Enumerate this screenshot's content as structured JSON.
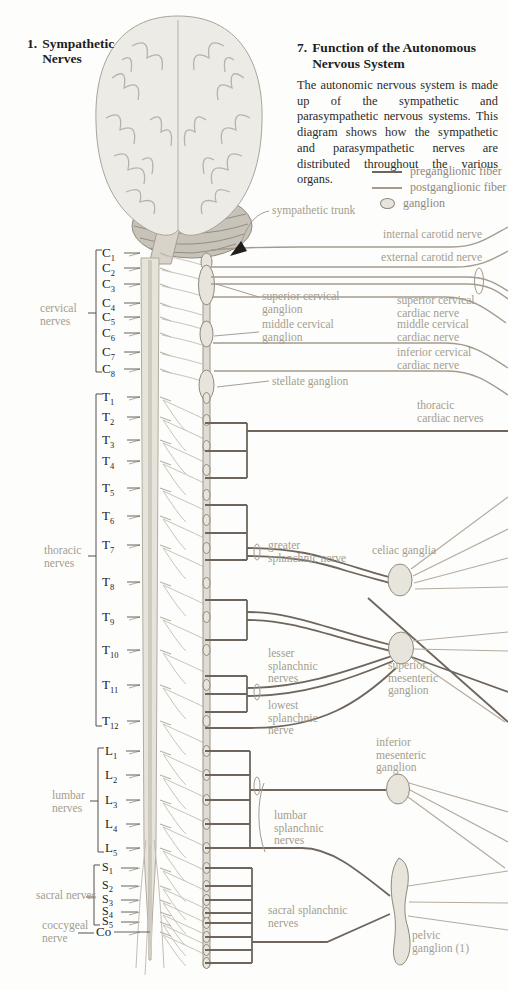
{
  "figure_title": {
    "number": "1.",
    "text": "Sympathetic Nerves"
  },
  "section": {
    "number": "7.",
    "title": "Function of the Autonomous Nervous System",
    "body": "The autonomic nervous system is made up of the sympathetic and parasympathetic nervous systems. This diagram shows how the sympathetic and parasympathetic nerves are distributed throughout the various organs."
  },
  "legend": [
    {
      "id": "preganglionic",
      "label": "preganglionic fiber",
      "swatch": "line-dark"
    },
    {
      "id": "postganglionic",
      "label": "postganglionic fiber",
      "swatch": "line-light"
    },
    {
      "id": "ganglion",
      "label": "ganglion",
      "swatch": "ellipse"
    }
  ],
  "colors": {
    "pre": "#6e665d",
    "post": "#a49a8e",
    "fan": "#b5ab9e",
    "gangfill": "#e7e4db",
    "gangstroke": "#8f897d",
    "labeltext": "#a49d8f"
  },
  "spinal_groups": [
    {
      "id": "cervical",
      "label_lines": [
        "cervical",
        "nerves"
      ],
      "segments": [
        "C1",
        "C2",
        "C3",
        "C4",
        "C5",
        "C6",
        "C7",
        "C8"
      ]
    },
    {
      "id": "thoracic",
      "label_lines": [
        "thoracic",
        "nerves"
      ],
      "segments": [
        "T1",
        "T2",
        "T3",
        "T4",
        "T5",
        "T6",
        "T7",
        "T8",
        "T9",
        "T10",
        "T11",
        "T12"
      ]
    },
    {
      "id": "lumbar",
      "label_lines": [
        "lumbar",
        "nerves"
      ],
      "segments": [
        "L1",
        "L2",
        "L3",
        "L4",
        "L5"
      ]
    },
    {
      "id": "sacral",
      "label_lines": [
        "sacral nerves"
      ],
      "segments": [
        "S1",
        "S2",
        "S3",
        "S4",
        "S5"
      ]
    },
    {
      "id": "coccygeal",
      "label_lines": [
        "coccygeal",
        "nerve"
      ],
      "segments": [
        "Co"
      ]
    }
  ],
  "diagram_labels": [
    {
      "id": "sympathetic-trunk",
      "lines": [
        "sympathetic trunk"
      ]
    },
    {
      "id": "internal-carotid-nerve",
      "lines": [
        "internal carotid nerve"
      ]
    },
    {
      "id": "external-carotid-nerve",
      "lines": [
        "external carotid nerve"
      ]
    },
    {
      "id": "superior-cervical-ganglion",
      "lines": [
        "superior cervical",
        "ganglion"
      ]
    },
    {
      "id": "superior-cervical-cardiac-nerve",
      "lines": [
        "superior cervical",
        "cardiac nerve"
      ]
    },
    {
      "id": "middle-cervical-ganglion",
      "lines": [
        "middle cervical",
        "ganglion"
      ]
    },
    {
      "id": "middle-cervical-cardiac-nerve",
      "lines": [
        "middle cervical",
        "cardiac nerve"
      ]
    },
    {
      "id": "inferior-cervical-cardiac-nerve",
      "lines": [
        "inferior cervical",
        "cardiac nerve"
      ]
    },
    {
      "id": "stellate-ganglion",
      "lines": [
        "stellate ganglion"
      ]
    },
    {
      "id": "thoracic-cardiac-nerves",
      "lines": [
        "thoracic",
        "cardiac nerves"
      ]
    },
    {
      "id": "greater-splanchnic-nerve",
      "lines": [
        "greater",
        "splanchnic nerve"
      ]
    },
    {
      "id": "celiac-ganglia",
      "lines": [
        "celiac ganglia"
      ]
    },
    {
      "id": "lesser-splanchnic-nerves",
      "lines": [
        "lesser",
        "splanchnic",
        "nerves"
      ]
    },
    {
      "id": "superior-mesenteric-ganglion",
      "lines": [
        "superior",
        "mesenteric",
        "ganglion"
      ]
    },
    {
      "id": "lowest-splanchnic-nerve",
      "lines": [
        "lowest",
        "splanchnic",
        "nerve"
      ]
    },
    {
      "id": "inferior-mesenteric-ganglion",
      "lines": [
        "inferior",
        "mesenteric",
        "ganglion"
      ]
    },
    {
      "id": "lumbar-splanchnic-nerves",
      "lines": [
        "lumbar",
        "splanchnic",
        "nerves"
      ]
    },
    {
      "id": "sacral-splanchnic-nerves",
      "lines": [
        "sacral splanchnic",
        "nerves"
      ]
    },
    {
      "id": "pelvic-ganglion",
      "lines": [
        "pelvic",
        "ganglion (1)"
      ]
    }
  ]
}
